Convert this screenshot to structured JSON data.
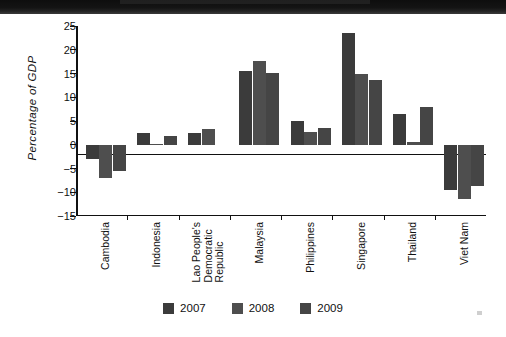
{
  "chart_data": {
    "type": "bar",
    "title": "",
    "xlabel": "",
    "ylabel": "Percentage of GDP",
    "ylim": [
      -15,
      25
    ],
    "yticks": [
      "25",
      "20",
      "15",
      "10",
      "5",
      "0",
      "−5",
      "−10",
      "−15"
    ],
    "grid": false,
    "legend_position": "bottom",
    "categories": [
      "Cambodia",
      "Indonesia",
      "Lao People's Democratic Republic",
      "Malaysia",
      "Philippines",
      "Singapore",
      "Thailand",
      "Viet Nam"
    ],
    "category_lines": [
      [
        "Cambodia"
      ],
      [
        "Indonesia"
      ],
      [
        "Lao People's",
        "Democratic",
        "Republic"
      ],
      [
        "Malaysia"
      ],
      [
        "Philippines"
      ],
      [
        "Singapore"
      ],
      [
        "Thailand"
      ],
      [
        "Viet Nam"
      ]
    ],
    "series": [
      {
        "name": "2007",
        "color": "#3b3b3b",
        "values": [
          -3.0,
          2.4,
          2.5,
          15.5,
          5.0,
          23.6,
          6.5,
          -9.6
        ]
      },
      {
        "name": "2008",
        "color": "#4e4e4e",
        "values": [
          -7.0,
          0.2,
          3.4,
          17.6,
          2.6,
          15.0,
          0.6,
          -11.5
        ]
      },
      {
        "name": "2009",
        "color": "#454545",
        "values": [
          -5.5,
          1.9,
          0.0,
          15.1,
          3.6,
          13.6,
          8.0,
          -8.7
        ]
      }
    ]
  },
  "legend": {
    "items": [
      {
        "label": "2007"
      },
      {
        "label": "2008"
      },
      {
        "label": "2009"
      }
    ]
  }
}
